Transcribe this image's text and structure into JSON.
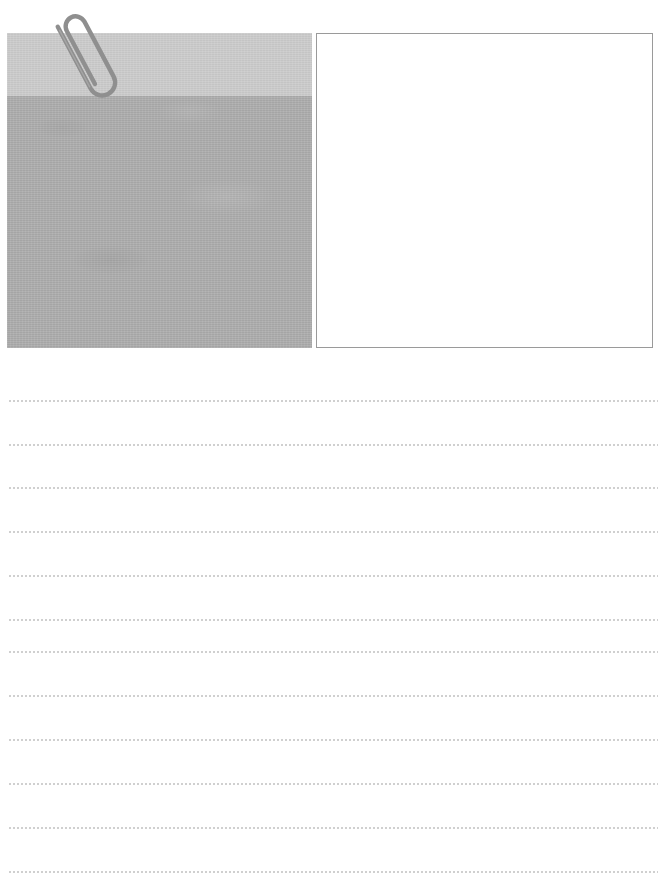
{
  "page": {
    "width": 665,
    "height": 888,
    "background_color": "#ffffff"
  },
  "media_area": {
    "photo": {
      "name": "photograph-placeholder",
      "alt_text": "",
      "x": 7,
      "y": 33,
      "width": 305,
      "height": 315,
      "bands": [
        {
          "label": "sky-band",
          "color": "#c9c9c9",
          "height": 63
        },
        {
          "label": "ground-band",
          "color": "#a9a9a9",
          "height": 252
        }
      ]
    },
    "paperclip": {
      "name": "paperclip",
      "color": "#8f8f8f",
      "stroke_width": 4,
      "rotation_degrees": -28
    },
    "note_card": {
      "name": "blank-note-card",
      "text": "",
      "x": 316,
      "y": 33,
      "width": 337,
      "height": 315,
      "background_color": "#ffffff",
      "border_color": "#9a9a9a"
    }
  },
  "ruled_area": {
    "line_color": "#9d9d9d",
    "line_style": "dotted",
    "left": 8,
    "width": 650,
    "lines": [
      {
        "index": 1,
        "y": 40,
        "text": ""
      },
      {
        "index": 2,
        "y": 84,
        "text": ""
      },
      {
        "index": 3,
        "y": 127,
        "text": ""
      },
      {
        "index": 4,
        "y": 171,
        "text": ""
      },
      {
        "index": 5,
        "y": 215,
        "text": ""
      },
      {
        "index": 6,
        "y": 259,
        "text": ""
      },
      {
        "index": 7,
        "y": 291,
        "text": ""
      },
      {
        "index": 8,
        "y": 335,
        "text": ""
      },
      {
        "index": 9,
        "y": 379,
        "text": ""
      },
      {
        "index": 10,
        "y": 423,
        "text": ""
      },
      {
        "index": 11,
        "y": 467,
        "text": ""
      },
      {
        "index": 12,
        "y": 511,
        "text": ""
      }
    ]
  }
}
